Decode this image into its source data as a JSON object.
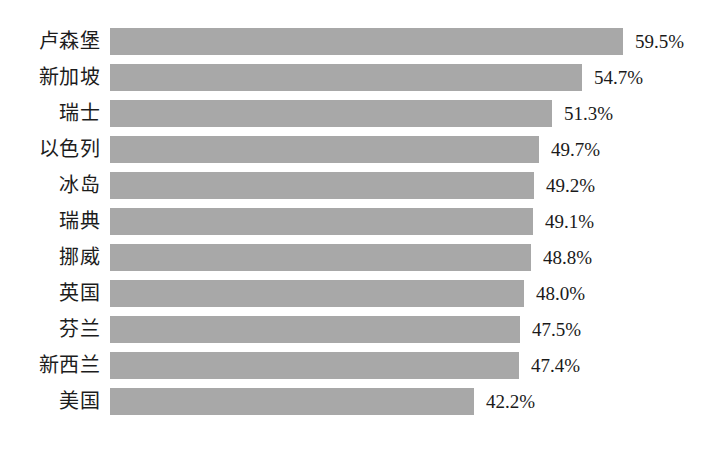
{
  "chart_data": {
    "type": "bar",
    "orientation": "horizontal",
    "title": "",
    "subtitle": "",
    "xlabel": "",
    "ylabel": "",
    "categories": [
      "卢森堡",
      "新加坡",
      "瑞士",
      "以色列",
      "冰岛",
      "瑞典",
      "挪威",
      "英国",
      "芬兰",
      "新西兰",
      "美国"
    ],
    "values": [
      59.5,
      54.7,
      51.3,
      49.7,
      49.2,
      49.1,
      48.8,
      48.0,
      47.5,
      47.4,
      42.2
    ],
    "value_labels": [
      "59.5%",
      "54.7%",
      "51.3%",
      "49.7%",
      "49.2%",
      "49.1%",
      "48.8%",
      "48.0%",
      "47.5%",
      "47.4%",
      "42.2%"
    ],
    "unit": "%",
    "xlim": [
      0,
      59.5
    ],
    "grid": false,
    "legend": false,
    "axis_visible": false,
    "tick_labels": [],
    "bar_color": "#a8a8a8",
    "background_color": "#ffffff",
    "text_color": "#1a1a1a",
    "sorted": "descending"
  }
}
